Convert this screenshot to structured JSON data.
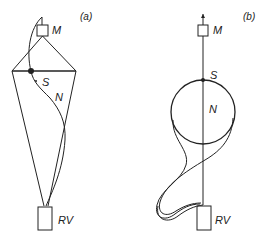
{
  "panels": [
    {
      "id": "a",
      "label": "(a)",
      "nodes": {
        "M": "M",
        "S": "S",
        "N": "N",
        "RV": "RV"
      }
    },
    {
      "id": "b",
      "label": "(b)",
      "nodes": {
        "M": "M",
        "S": "S",
        "N": "N",
        "RV": "RV"
      }
    }
  ],
  "colors": {
    "stroke": "#222222",
    "background": "#ffffff"
  }
}
